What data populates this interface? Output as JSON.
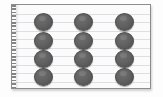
{
  "scene": {
    "title": "Ruled notepad sheet with a grid of dark gray circular counters",
    "background_color": "#ffffff"
  },
  "sheet": {
    "name": "notepad-sheet",
    "paper_color": "#fbfbfb",
    "border_color": "#8d8d8d",
    "rule_line_color": "#dcdfe3",
    "rule_line_count": 9,
    "has_perforated_left_edge": true,
    "perforation_color": "#6f6f6f",
    "shadow": "drop shadow bottom-right"
  },
  "grid": {
    "name": "counter-grid",
    "rows": 4,
    "columns": 3,
    "total_count": 12,
    "dot_color": "#616161",
    "dot_outline_color": "#4a4a4a",
    "dot_diameter_px": 19,
    "column_x": [
      22,
      62,
      103
    ],
    "row_y": [
      8,
      27,
      45,
      63
    ],
    "items": [
      {
        "row": 1,
        "col": 1,
        "label": "counter-1"
      },
      {
        "row": 1,
        "col": 2,
        "label": "counter-2"
      },
      {
        "row": 1,
        "col": 3,
        "label": "counter-3"
      },
      {
        "row": 2,
        "col": 1,
        "label": "counter-4"
      },
      {
        "row": 2,
        "col": 2,
        "label": "counter-5"
      },
      {
        "row": 2,
        "col": 3,
        "label": "counter-6"
      },
      {
        "row": 3,
        "col": 1,
        "label": "counter-7"
      },
      {
        "row": 3,
        "col": 2,
        "label": "counter-8"
      },
      {
        "row": 3,
        "col": 3,
        "label": "counter-9"
      },
      {
        "row": 4,
        "col": 1,
        "label": "counter-10"
      },
      {
        "row": 4,
        "col": 2,
        "label": "counter-11"
      },
      {
        "row": 4,
        "col": 3,
        "label": "counter-12"
      }
    ]
  }
}
